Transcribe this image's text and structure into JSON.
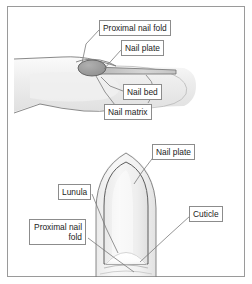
{
  "figure": {
    "frame_color": "#9a9a9a",
    "background_color": "#ffffff",
    "panels": [
      {
        "id": "sagittal-section",
        "description": "Side view sagittal section of a fingertip showing nail structures"
      },
      {
        "id": "dorsal-view",
        "description": "Dorsal (top) view of a fingertip showing the nail plate, lunula and cuticle"
      }
    ]
  },
  "labels": {
    "top_panel": {
      "proximal_nail_fold": "Proximal nail fold",
      "nail_plate": "Nail plate",
      "nail_bed": "Nail bed",
      "nail_matrix": "Nail matrix"
    },
    "bottom_panel": {
      "nail_plate": "Nail plate",
      "lunula": "Lunula",
      "cuticle": "Cuticle",
      "proximal_nail_fold": "Proximal nail fold"
    }
  },
  "colors": {
    "outline": "#6e6e6e",
    "label_border": "#8c8c8c",
    "label_text": "#1b1b1b",
    "skin_light": "#f2f2f2",
    "skin_shade": "#e6e6e6",
    "nail_matrix_fill": "#9a9a9a",
    "nail_plate_fill": "#d8d8d8",
    "lunula_fill": "#ffffff",
    "leader_line": "#7a7a7a"
  }
}
